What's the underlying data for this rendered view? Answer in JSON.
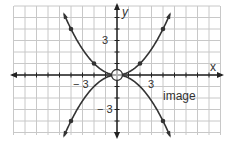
{
  "chart_data": {
    "type": "line",
    "title": "",
    "xlabel": "x",
    "ylabel": "y",
    "xlim": [
      -9,
      9
    ],
    "ylim": [
      -5,
      6
    ],
    "grid": true,
    "tick_labels": {
      "x": [
        "-3",
        "3"
      ],
      "y": [
        "3",
        "-3"
      ]
    },
    "series": [
      {
        "name": "parent",
        "equation": "y = x^2/4",
        "points": [
          [
            -4,
            4
          ],
          [
            -2,
            1
          ],
          [
            0,
            0
          ],
          [
            2,
            1
          ],
          [
            4,
            4
          ]
        ]
      },
      {
        "name": "image",
        "equation": "y = -x^2/4",
        "points": [
          [
            -4,
            -4
          ],
          [
            0,
            0
          ],
          [
            4,
            -4
          ]
        ]
      }
    ],
    "annotations": [
      {
        "text": "image",
        "x": 4,
        "y": -2
      }
    ],
    "highlight": {
      "shape": "open-circle",
      "at": [
        0,
        0
      ]
    }
  },
  "labels": {
    "x_axis": "x",
    "y_axis": "y",
    "x_neg3": "− 3",
    "x_pos3": "3",
    "y_pos3": "3",
    "y_neg3": "− 3",
    "image": "image"
  },
  "colors": {
    "grid": "#c8c8c8",
    "axis": "#222222",
    "curve": "#333333"
  }
}
